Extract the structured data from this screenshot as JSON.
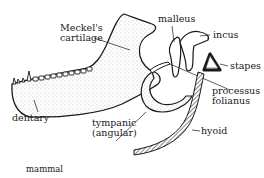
{
  "figure": {
    "caption": "mammal",
    "labels": {
      "meckels_cartilage_line1": "Meckel's",
      "meckels_cartilage_line2": "cartilage",
      "malleus": "malleus",
      "incus": "incus",
      "stapes": "stapes",
      "processus_folianus_line1": "processus",
      "processus_folianus_line2": "folianus",
      "dentary": "dentary",
      "tympanic_line1": "tympanic",
      "tympanic_line2": "(angular)",
      "hyoid": "hyoid"
    },
    "colors": {
      "ink": "#1a1a1a",
      "stipple_fill": "#e4e4e4",
      "background": "#ffffff"
    }
  }
}
